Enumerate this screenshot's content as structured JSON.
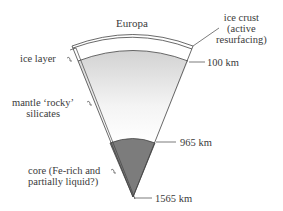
{
  "title": "Europa",
  "labels": {
    "ice_crust": [
      "ice crust",
      "(active",
      "resurfacing)"
    ],
    "ice_layer": "ice layer",
    "mantle": [
      "mantle ‘rocky’",
      "silicates"
    ],
    "core": [
      "core (Fe-rich and",
      "partially liquid?)"
    ]
  },
  "depths": {
    "d1": "100 km",
    "d2": "965 km",
    "d3": "1565 km"
  },
  "colors": {
    "core": "#7a7a7a",
    "mantle_top": "#d4d4d4",
    "mantle_bottom": "#ffffff",
    "outline": "#444444"
  }
}
